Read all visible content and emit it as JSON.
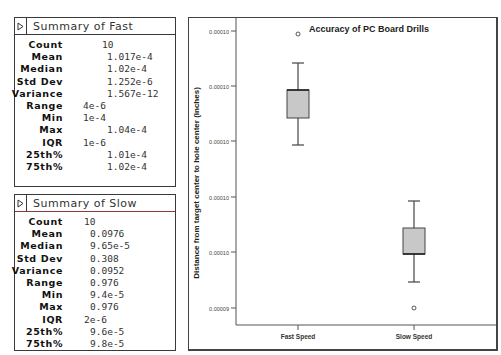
{
  "summary_fast": {
    "title": "Summary of Fast",
    "stats": [
      {
        "label": "Count",
        "value": "10"
      },
      {
        "label": "Mean",
        "value": "1.017e-4"
      },
      {
        "label": "Median",
        "value": "1.02e-4"
      },
      {
        "label": "Std Dev",
        "value": "1.252e-6"
      },
      {
        "label": "Variance",
        "value": "1.567e-12"
      },
      {
        "label": "Range",
        "value": "4e-6"
      },
      {
        "label": "Min",
        "value": "1e-4"
      },
      {
        "label": "Max",
        "value": "1.04e-4"
      },
      {
        "label": "IQR",
        "value": "1e-6"
      },
      {
        "label": "25th%",
        "value": "1.01e-4"
      },
      {
        "label": "75th%",
        "value": "1.02e-4"
      }
    ]
  },
  "summary_slow": {
    "title": "Summary of Slow",
    "stats": [
      {
        "label": "Count",
        "value": "10"
      },
      {
        "label": "Mean",
        "value": "0.0976"
      },
      {
        "label": "Median",
        "value": "9.65e-5"
      },
      {
        "label": "Std Dev",
        "value": "0.308"
      },
      {
        "label": "Variance",
        "value": "0.0952"
      },
      {
        "label": "Range",
        "value": "0.976"
      },
      {
        "label": "Min",
        "value": "9.4e-5"
      },
      {
        "label": "Max",
        "value": "0.976"
      },
      {
        "label": "IQR",
        "value": "2e-6"
      },
      {
        "label": "25th%",
        "value": "9.6e-5"
      },
      {
        "label": "75th%",
        "value": "9.8e-5"
      }
    ]
  },
  "icons": {
    "disclosure": "triangle-right"
  },
  "colors": {
    "box_fill": "#c8c8c8",
    "axis": "#555555",
    "panel_border": "#3a3a3a"
  },
  "chart_data": {
    "type": "box",
    "title": "Accuracy of PC Board Drills",
    "xlabel": "",
    "ylabel": "Distance from target center to hole center (inches)",
    "categories": [
      "Fast Speed",
      "Slow Speed"
    ],
    "y_tick_labels": [
      "0.00010",
      "0.00010",
      "0.00010",
      "0.00010",
      "0.00010",
      "0.00009"
    ],
    "series": [
      {
        "name": "Fast Speed",
        "whisker_low": 0.0001,
        "q1": 0.000101,
        "median": 0.000101,
        "q3": 0.000102,
        "whisker_high": 0.000103,
        "outliers": [
          0.000104
        ]
      },
      {
        "name": "Slow Speed",
        "whisker_low": 9.5e-05,
        "q1": 9.6e-05,
        "median": 9.6e-05,
        "q3": 9.8e-05,
        "whisker_high": 9.9e-05,
        "outliers": [
          9.4e-05
        ]
      }
    ],
    "grid": false,
    "legend": "none"
  }
}
